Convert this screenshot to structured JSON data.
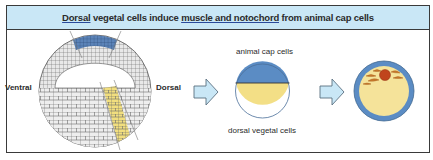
{
  "title": {
    "part1_underlined": "Dorsal",
    "part2": " vegetal cells induce ",
    "part3_underlined": "muscle and notochord",
    "part4": " from animal cap cells"
  },
  "panel1": {
    "left_label": "Ventral",
    "right_label": "Dorsal",
    "description": "Blastula cross-section with blue animal cap and yellow dorsal vegetal region"
  },
  "panel2": {
    "top_label": "animal cap cells",
    "bottom_label": "dorsal vegetal cells"
  },
  "panel3": {
    "description": "Induced tissue: muscle and notochord inside animal cap explant"
  },
  "icons": {
    "arrow1": "right-arrow-icon",
    "arrow2": "right-arrow-icon"
  },
  "colors": {
    "title_bg": "#c9e7f6",
    "animal_cap_blue": "#5b8cc4",
    "vegetal_yellow": "#f3df86",
    "arrow_fill": "#c9e7f6",
    "tissue_red": "#c0451c",
    "tissue_orange": "#d07a2a",
    "cell_gray": "#e6e6e6",
    "cell_outline": "#6a6a6a"
  }
}
